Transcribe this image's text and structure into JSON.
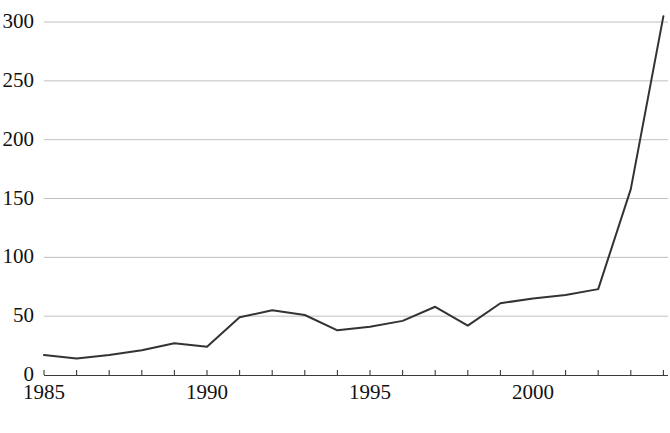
{
  "chart_data": {
    "type": "line",
    "title": "",
    "subtitle": "",
    "xlabel": "",
    "ylabel": "",
    "x": [
      1985,
      1986,
      1987,
      1988,
      1989,
      1990,
      1991,
      1992,
      1993,
      1994,
      1995,
      1996,
      1997,
      1998,
      1999,
      2000,
      2001,
      2002,
      2003,
      2004
    ],
    "series": [
      {
        "name": "",
        "values": [
          17,
          14,
          17,
          21,
          27,
          24,
          49,
          55,
          51,
          38,
          41,
          46,
          58,
          42,
          61,
          65,
          68,
          73,
          158,
          305
        ]
      }
    ],
    "xlim": [
      1985,
      2004
    ],
    "ylim": [
      0,
      310
    ],
    "xticks": [
      1985,
      1986,
      1987,
      1988,
      1989,
      1990,
      1991,
      1992,
      1993,
      1994,
      1995,
      1996,
      1997,
      1998,
      1999,
      2000,
      2001,
      2002,
      2003,
      2004
    ],
    "xtick_labels_shown": [
      "1985",
      "1990",
      "1995",
      "2000"
    ],
    "xtick_labels_shown_values": [
      1985,
      1990,
      1995,
      2000
    ],
    "yticks": [
      0,
      50,
      100,
      150,
      200,
      250,
      300
    ],
    "ytick_labels": [
      "0",
      "50",
      "100",
      "150",
      "200",
      "250",
      "300"
    ],
    "grid": true,
    "grid_axis": "y",
    "legend": false,
    "legend_position": "none",
    "line_color": "#333333",
    "grid_color": "#bfbfbf",
    "axis_color": "#3a3a3a",
    "background_color": "#ffffff"
  }
}
